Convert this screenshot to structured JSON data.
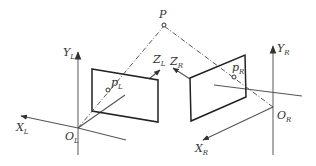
{
  "diagram": {
    "labels": {
      "point_world": "P",
      "left_image_point": {
        "main": "p",
        "sub": "L"
      },
      "right_image_point": {
        "main": "p",
        "sub": "R"
      },
      "left_y_axis": {
        "main": "Y",
        "sub": "L"
      },
      "left_x_axis": {
        "main": "X",
        "sub": "L"
      },
      "left_z_axis": {
        "main": "Z",
        "sub": "L"
      },
      "left_origin": {
        "main": "O",
        "sub": "L"
      },
      "right_y_axis": {
        "main": "Y",
        "sub": "R"
      },
      "right_x_axis": {
        "main": "X",
        "sub": "R"
      },
      "right_z_axis": {
        "main": "Z",
        "sub": "R"
      },
      "right_origin": {
        "main": "O",
        "sub": "R"
      }
    },
    "colors": {
      "line": "#222222",
      "axis_gray": "#888888",
      "background": "#ffffff"
    }
  }
}
